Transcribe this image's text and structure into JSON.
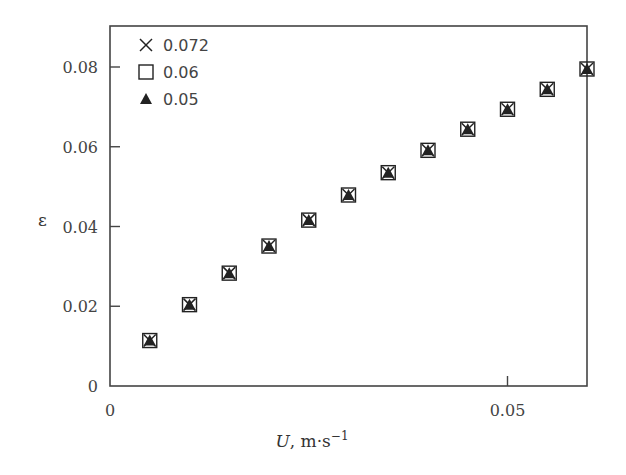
{
  "chart_data": {
    "type": "scatter",
    "title": "",
    "xlabel": "U, m·s⁻¹",
    "xlabel_italic_part": "U",
    "xlabel_unit": ", m·s",
    "xlabel_exp": "−1",
    "ylabel": "ε",
    "xlim": [
      0,
      0.06
    ],
    "ylim": [
      0,
      0.09
    ],
    "xticks": [
      0,
      0.05
    ],
    "xtick_labels": [
      "0",
      "0.05"
    ],
    "yticks": [
      0,
      0.02,
      0.04,
      0.06,
      0.08
    ],
    "ytick_labels": [
      "0",
      "0.02",
      "0.04",
      "0.06",
      "0.08"
    ],
    "grid": false,
    "legend_position": "upper left",
    "x": [
      0.005,
      0.01,
      0.015,
      0.02,
      0.025,
      0.03,
      0.035,
      0.04,
      0.045,
      0.05,
      0.055,
      0.06
    ],
    "series": [
      {
        "name": "0.072",
        "marker": "x",
        "values": [
          0.0114,
          0.0204,
          0.0283,
          0.0351,
          0.0416,
          0.0479,
          0.0535,
          0.0591,
          0.0644,
          0.0694,
          0.0744,
          0.0795
        ]
      },
      {
        "name": "0.06",
        "marker": "open-square",
        "values": [
          0.0114,
          0.0204,
          0.0283,
          0.0351,
          0.0416,
          0.0479,
          0.0535,
          0.0591,
          0.0644,
          0.0694,
          0.0744,
          0.0795
        ]
      },
      {
        "name": "0.05",
        "marker": "filled-triangle",
        "values": [
          0.0114,
          0.0204,
          0.0283,
          0.0351,
          0.0416,
          0.0479,
          0.0535,
          0.0591,
          0.0644,
          0.0694,
          0.0744,
          0.0795
        ]
      }
    ]
  },
  "legend": {
    "items": [
      {
        "label": "0.072",
        "marker": "x"
      },
      {
        "label": "0.06",
        "marker": "open-square"
      },
      {
        "label": "0.05",
        "marker": "filled-triangle"
      }
    ]
  },
  "colors": {
    "axis": "#444444",
    "marker": "#222222"
  }
}
